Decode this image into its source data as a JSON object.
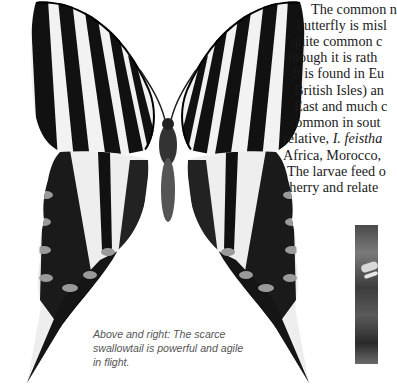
{
  "article": {
    "body_lines": [
      "The common n",
      "butterfly is misl",
      "quite common c",
      "though it is rath",
      "It is found in Eu",
      "British Isles) an",
      "East and much c",
      "common in sout",
      "relative, ",
      "Africa, Morocco,",
      "The larvae feed o",
      "cherry and relate"
    ],
    "italic_fragment": "I. feistha",
    "caption_lines": [
      "Above and right: The scarce",
      "swallowtail is powerful and agile",
      "in flight."
    ]
  },
  "figures": {
    "main_illustration": "scarce-swallowtail-butterfly-drawing",
    "inset_photo": "butterfly-photo-cropped"
  },
  "colors": {
    "text": "#1a1a1a",
    "caption": "#555555",
    "background": "#ffffff"
  }
}
